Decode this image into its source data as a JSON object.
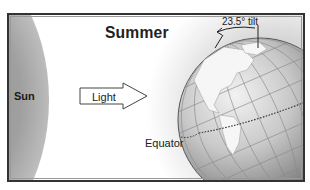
{
  "diagram": {
    "title": "Summer",
    "labels": {
      "sun": "Sun",
      "light": "Light",
      "tilt": "23.5° tilt",
      "equator": "Equator"
    },
    "tilt_degrees": 23.5,
    "colors": {
      "frame": "#333333",
      "sun": "#9a9a9a",
      "globe_dark": "#7a7a7a",
      "globe_light": "#e0e0e0",
      "land": "#f4f4f4",
      "text": "#222222"
    },
    "icons": [
      "sun-shape",
      "light-arrow-icon",
      "globe-icon",
      "tilt-arrow-icon",
      "equator-line"
    ]
  }
}
